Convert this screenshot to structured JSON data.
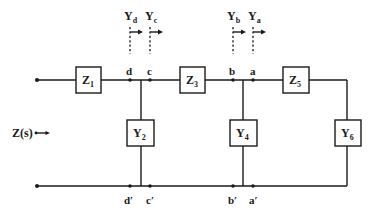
{
  "diagram": {
    "type": "ladder-network",
    "input_label": "Z(s)",
    "series_elements": [
      {
        "name": "Z",
        "sub": "1"
      },
      {
        "name": "Z",
        "sub": "3"
      },
      {
        "name": "Z",
        "sub": "5"
      }
    ],
    "shunt_elements": [
      {
        "name": "Y",
        "sub": "2"
      },
      {
        "name": "Y",
        "sub": "4"
      },
      {
        "name": "Y",
        "sub": "6"
      }
    ],
    "top_nodes": [
      "d",
      "c",
      "b",
      "a"
    ],
    "bottom_nodes": [
      "d′",
      "c′",
      "b′",
      "a′"
    ],
    "admittance_markers": [
      {
        "name": "Y",
        "sub": "d"
      },
      {
        "name": "Y",
        "sub": "c"
      },
      {
        "name": "Y",
        "sub": "b"
      },
      {
        "name": "Y",
        "sub": "a"
      }
    ]
  }
}
